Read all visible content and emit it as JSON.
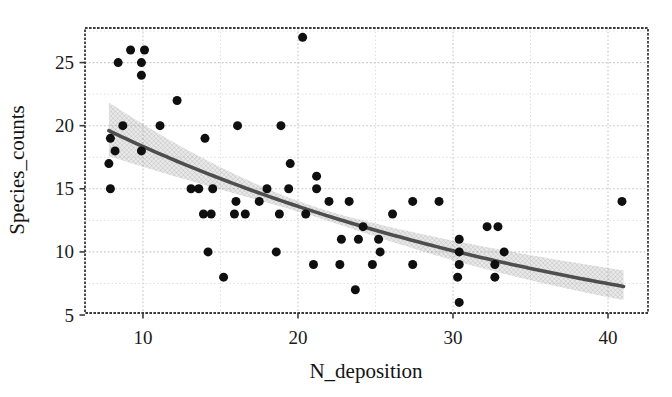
{
  "chart_data": {
    "type": "scatter",
    "title": "",
    "xlabel": "N_deposition",
    "ylabel": "Species_counts",
    "xlim": [
      6.26,
      42.58
    ],
    "ylim": [
      5.16,
      27.74
    ],
    "x_ticks": [
      10,
      20,
      30,
      40
    ],
    "y_ticks": [
      5,
      10,
      15,
      20,
      25
    ],
    "x_minor_grid": [
      15,
      25,
      35
    ],
    "y_minor_grid": [
      7.5,
      12.5,
      17.5,
      22.5,
      27.5
    ],
    "grid": true,
    "legend": "none",
    "points": [
      [
        8.4,
        25
      ],
      [
        9.2,
        26
      ],
      [
        10.1,
        26
      ],
      [
        9.9,
        25
      ],
      [
        9.9,
        24
      ],
      [
        12.2,
        22
      ],
      [
        8.7,
        20
      ],
      [
        11.1,
        20
      ],
      [
        7.9,
        19
      ],
      [
        8.2,
        18
      ],
      [
        9.9,
        18
      ],
      [
        7.8,
        17
      ],
      [
        7.9,
        15
      ],
      [
        13.1,
        15
      ],
      [
        14,
        19
      ],
      [
        16.1,
        20
      ],
      [
        18.9,
        20
      ],
      [
        20.3,
        27
      ],
      [
        13.6,
        15
      ],
      [
        14.5,
        15
      ],
      [
        13.9,
        13
      ],
      [
        14.4,
        13
      ],
      [
        16,
        14
      ],
      [
        17.5,
        14
      ],
      [
        15.9,
        13
      ],
      [
        16.6,
        13
      ],
      [
        18.8,
        13
      ],
      [
        20.5,
        13
      ],
      [
        14.2,
        10
      ],
      [
        15.2,
        8
      ],
      [
        19.5,
        17
      ],
      [
        21.2,
        16
      ],
      [
        18,
        15
      ],
      [
        19.4,
        15
      ],
      [
        21.2,
        15
      ],
      [
        22,
        14
      ],
      [
        23.3,
        14
      ],
      [
        18.6,
        10
      ],
      [
        21,
        9
      ],
      [
        24.2,
        12
      ],
      [
        22.8,
        11
      ],
      [
        23.9,
        11
      ],
      [
        25.2,
        11
      ],
      [
        25.3,
        10
      ],
      [
        24.8,
        9
      ],
      [
        22.7,
        9
      ],
      [
        23.7,
        7
      ],
      [
        26.1,
        13
      ],
      [
        27.4,
        14
      ],
      [
        29.1,
        14
      ],
      [
        27.4,
        9
      ],
      [
        30.4,
        11
      ],
      [
        30.4,
        10
      ],
      [
        30.4,
        9
      ],
      [
        30.3,
        8
      ],
      [
        30.4,
        6
      ],
      [
        32.2,
        12
      ],
      [
        32.9,
        12
      ],
      [
        33.3,
        10
      ],
      [
        32.7,
        9
      ],
      [
        32.7,
        8
      ],
      [
        40.9,
        14
      ]
    ],
    "fit_curve": {
      "model": "y = a * exp(b * x)",
      "a": 24.75,
      "b": -0.0299,
      "x_start": 7.8,
      "x_end": 41.0,
      "se_band": {
        "s0": 0.0009,
        "s1": 6.2e-05,
        "x_center": 21
      }
    },
    "colors": {
      "point": "#0f0f0f",
      "curve": "#4e4e4e",
      "band_base": "#9a9a9a",
      "band_hatch": "#6f6f6f",
      "grid_major": "#c8c8c8",
      "grid_minor": "#dfdfdf",
      "border": "#3a3a3a",
      "text": "#141414",
      "background": "#ffffff"
    }
  }
}
